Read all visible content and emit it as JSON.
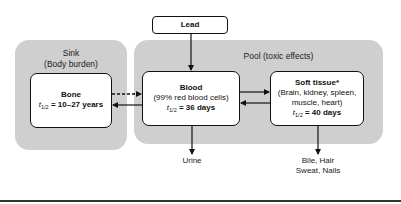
{
  "diagram": {
    "source_node": {
      "label": "Lead"
    },
    "compartments": [
      {
        "id": "sink",
        "title": "Sink",
        "subtitle": "(Body burden)"
      },
      {
        "id": "pool",
        "title": "Pool (toxic effects)"
      }
    ],
    "nodes": {
      "bone": {
        "title": "Bone",
        "half_life_symbol": "t",
        "half_life_sub": "1/2",
        "half_life_value": " = 10–27 years"
      },
      "blood": {
        "title": "Blood",
        "detail": "(99% red blood cells)",
        "half_life_symbol": "t",
        "half_life_sub": "1/2",
        "half_life_value": " = 36 days"
      },
      "soft_tissue": {
        "title": "Soft tissue*",
        "detail_line1": "(Brain, kidney, spleen,",
        "detail_line2": "muscle, heart)",
        "half_life_symbol": "t",
        "half_life_sub": "1/2",
        "half_life_value": " = 40 days"
      }
    },
    "outputs": {
      "urine": "Urine",
      "bile_line1": "Bile, Hair",
      "bile_line2": "Sweat, Nails"
    },
    "edges": [
      {
        "from": "Lead",
        "to": "Blood",
        "style": "solid"
      },
      {
        "from": "Bone",
        "to": "Blood",
        "style": "dashed"
      },
      {
        "from": "Blood",
        "to": "Bone",
        "style": "solid"
      },
      {
        "from": "Blood",
        "to": "Soft tissue",
        "style": "solid"
      },
      {
        "from": "Soft tissue",
        "to": "Blood",
        "style": "solid"
      },
      {
        "from": "Blood",
        "to": "Urine",
        "style": "solid"
      },
      {
        "from": "Soft tissue",
        "to": "Bile, Hair, Sweat, Nails",
        "style": "solid"
      }
    ],
    "colors": {
      "panel": "#cfcfcf",
      "node_fill": "#ffffff",
      "stroke": "#111111"
    }
  }
}
